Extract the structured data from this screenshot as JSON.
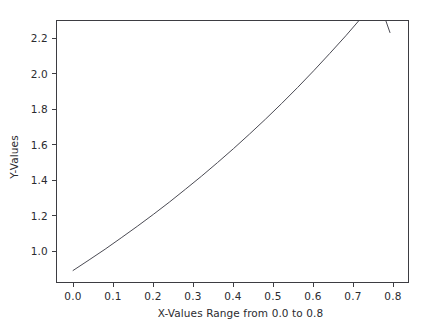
{
  "chart_data": {
    "type": "line",
    "title": "",
    "subtitle": "",
    "xlabel": "X-Values Range from 0.0 to 0.8",
    "ylabel": "Y-Values",
    "xlim": [
      -0.04,
      0.835
    ],
    "ylim": [
      0.94,
      2.3
    ],
    "xticks": [
      0.0,
      0.1,
      0.2,
      0.3,
      0.4,
      0.5,
      0.6,
      0.7,
      0.8
    ],
    "xtick_labels": [
      "0.0",
      "0.1",
      "0.2",
      "0.3",
      "0.4",
      "0.5",
      "0.6",
      "0.7",
      "0.8"
    ],
    "yticks": [
      1.0,
      1.2,
      1.4,
      1.6,
      1.8,
      2.0,
      2.2
    ],
    "ytick_labels": [
      "1.0",
      "1.2",
      "1.4",
      "1.6",
      "1.8",
      "2.0",
      "2.2"
    ],
    "grid": false,
    "legend": null,
    "legend_position": "none",
    "line_color": "#494952",
    "line_width": 1.0,
    "series": [
      {
        "name": "series-1",
        "x": [
          0.0,
          0.04,
          0.08,
          0.12,
          0.16,
          0.2,
          0.24,
          0.28,
          0.32,
          0.36,
          0.4,
          0.44,
          0.48,
          0.52,
          0.56,
          0.6,
          0.64,
          0.68,
          0.72,
          0.76,
          0.79
        ],
        "values": [
          1.0,
          1.055,
          1.111,
          1.17,
          1.23,
          1.292,
          1.356,
          1.423,
          1.491,
          1.562,
          1.635,
          1.711,
          1.789,
          1.87,
          1.954,
          2.041,
          2.131,
          2.223,
          2.32,
          2.42,
          2.24
        ]
      }
    ],
    "annotations": []
  },
  "figure": {
    "background": "#ffffff",
    "axes_edge_color": "#3d3d42",
    "tick_color": "#3d3d42",
    "text_color": "#2b2b2f"
  }
}
